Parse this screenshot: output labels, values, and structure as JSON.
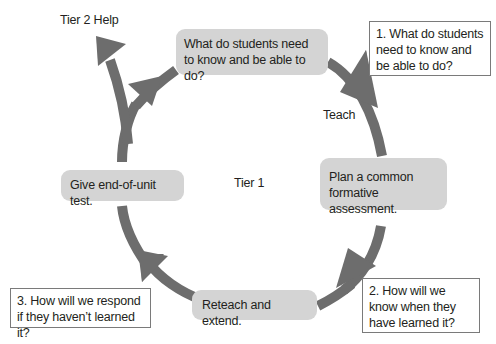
{
  "colors": {
    "arrow": "#6d6d6d",
    "stage_fill": "#d4d4d4",
    "question_border": "#7a7a7a",
    "text": "#231f20"
  },
  "labels": {
    "tier2": "Tier 2 Help",
    "teach": "Teach",
    "tier1": "Tier 1"
  },
  "stages": [
    {
      "id": "know",
      "text": "What do students need to know and be able to do?"
    },
    {
      "id": "plan",
      "text": "Plan a common formative assessment."
    },
    {
      "id": "reteach",
      "text": "Reteach and extend."
    },
    {
      "id": "test",
      "text": "Give end-of-unit test."
    }
  ],
  "questions": [
    {
      "id": "q1",
      "text": "1. What do students need to know and be able to do?"
    },
    {
      "id": "q2",
      "text": "2. How will we know when they have learned it?"
    },
    {
      "id": "q3",
      "text": "3. How will we respond if they haven’t learned it?"
    }
  ]
}
